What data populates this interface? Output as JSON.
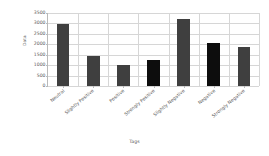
{
  "chart_data": {
    "type": "bar",
    "title": "",
    "xlabel": "Tags",
    "ylabel": "Data",
    "categories": [
      "Neutral",
      "Slightly Positive",
      "Positive",
      "Strongly Positive",
      "Slightly Negative",
      "Negative",
      "Strongly Negative"
    ],
    "values": [
      2950,
      1430,
      1010,
      1270,
      3200,
      2050,
      1860
    ],
    "bar_colors": [
      "#3f3f3f",
      "#3f3f3f",
      "#3f3f3f",
      "#0d0d0d",
      "#3f3f3f",
      "#0d0d0d",
      "#3f3f3f"
    ],
    "ylim": [
      0,
      3500
    ],
    "yticks": [
      0,
      500,
      1000,
      1500,
      2000,
      2500,
      3000,
      3500
    ],
    "ytick_labels": [
      "0",
      "500",
      "1000",
      "1500",
      "2000",
      "2500",
      "3000",
      "3500"
    ],
    "grid": true,
    "legend": false
  }
}
